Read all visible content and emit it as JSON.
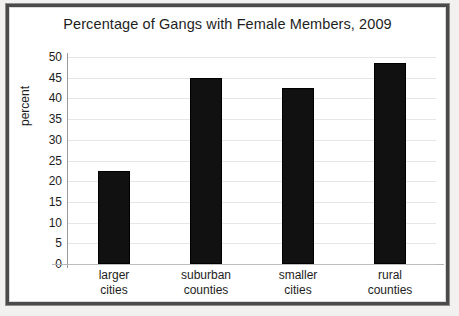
{
  "figure": {
    "title": "Percentage of Gangs with Female Members, 2009",
    "frame_color": "#4a4a4a",
    "background": "#ffffff"
  },
  "chart_data": {
    "type": "bar",
    "title": "Percentage of Gangs with Female Members, 2009",
    "xlabel": "",
    "ylabel": "percent",
    "categories": [
      "larger cities",
      "suburban counties",
      "smaller cities",
      "rural counties"
    ],
    "category_lines": [
      [
        "larger",
        "cities"
      ],
      [
        "suburban",
        "counties"
      ],
      [
        "smaller",
        "cities"
      ],
      [
        "rural",
        "counties"
      ]
    ],
    "values": [
      22.5,
      45,
      42.5,
      48.5
    ],
    "ylim": [
      0,
      50
    ],
    "ytick_step": 5,
    "yticks": [
      50,
      45,
      40,
      35,
      30,
      25,
      20,
      15,
      10,
      5,
      0
    ],
    "ytick_labels": [
      "50",
      "45",
      "40",
      "35",
      "30",
      "25",
      "20",
      "15",
      "10",
      "5",
      "0"
    ],
    "grid": true,
    "grid_axis": "y",
    "legend": false,
    "bar_color": "#111111",
    "gridline_color": "#e6e6e6",
    "axis_color": "#9a9a9a"
  }
}
